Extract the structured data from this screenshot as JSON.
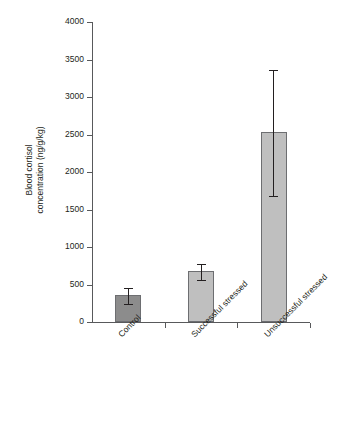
{
  "chart_data": {
    "type": "bar",
    "title": "",
    "xlabel": "",
    "ylabel_line1": "Blood cortisol",
    "ylabel_line2": "concentration (ng/g/kg)",
    "ylabel": "Blood cortisol concentration (ng/g/kg)",
    "categories": [
      "Control",
      "Successful stressed",
      "Unsuccessful stressed"
    ],
    "values": [
      360,
      680,
      2530
    ],
    "error_low": [
      235,
      555,
      1680
    ],
    "error_high": [
      460,
      775,
      3360
    ],
    "ylim": [
      0,
      4000
    ],
    "yticks": [
      0,
      500,
      1000,
      1500,
      2000,
      2500,
      3000,
      3500,
      4000
    ],
    "ytick_labels": [
      "0",
      "500",
      "1000",
      "1500",
      "2000",
      "2500",
      "3000",
      "3500",
      "4000"
    ],
    "grid": false,
    "legend": "none",
    "bar_colors": [
      "#8c8c8c",
      "#bfbfbf",
      "#bfbfbf"
    ],
    "bar_edge_color": "#6d6e71",
    "axis_color": "#58595b",
    "error_color": "#231f20",
    "text_color": "#231f20"
  }
}
